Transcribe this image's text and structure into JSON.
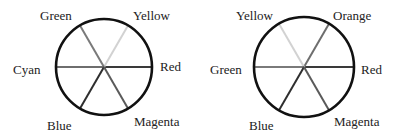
{
  "wheels": [
    {
      "name": "rgb-color-wheel",
      "cx": 104,
      "cy": 67,
      "r": 48,
      "spokes": [
        {
          "label": "Red",
          "angle": 0,
          "color": "#3a3a3a",
          "lx": 160,
          "ly": 71,
          "anchor": "start"
        },
        {
          "label": "Yellow",
          "angle": 60,
          "color": "#d2d2d2",
          "lx": 133,
          "ly": 20,
          "anchor": "start"
        },
        {
          "label": "Green",
          "angle": 120,
          "color": "#7a7a7a",
          "lx": 40,
          "ly": 20,
          "anchor": "start"
        },
        {
          "label": "Cyan",
          "angle": 180,
          "color": "#6e6e6e",
          "lx": 13,
          "ly": 74,
          "anchor": "start"
        },
        {
          "label": "Blue",
          "angle": 240,
          "color": "#2e2e2e",
          "lx": 47,
          "ly": 130,
          "anchor": "start"
        },
        {
          "label": "Magenta",
          "angle": 300,
          "color": "#5a5a5a",
          "lx": 134,
          "ly": 126,
          "anchor": "start"
        }
      ]
    },
    {
      "name": "ryb-color-wheel",
      "cx": 304,
      "cy": 67,
      "r": 50,
      "spokes": [
        {
          "label": "Red",
          "angle": 0,
          "color": "#3a3a3a",
          "lx": 361,
          "ly": 74,
          "anchor": "start"
        },
        {
          "label": "Orange",
          "angle": 60,
          "color": "#6e6e6e",
          "lx": 333,
          "ly": 20,
          "anchor": "start"
        },
        {
          "label": "Yellow",
          "angle": 120,
          "color": "#d2d2d2",
          "lx": 236,
          "ly": 20,
          "anchor": "start"
        },
        {
          "label": "Green",
          "angle": 180,
          "color": "#7a7a7a",
          "lx": 210,
          "ly": 74,
          "anchor": "start"
        },
        {
          "label": "Blue",
          "angle": 240,
          "color": "#2e2e2e",
          "lx": 249,
          "ly": 130,
          "anchor": "start"
        },
        {
          "label": "Magenta",
          "angle": 300,
          "color": "#5a5a5a",
          "lx": 334,
          "ly": 126,
          "anchor": "start"
        }
      ]
    }
  ]
}
